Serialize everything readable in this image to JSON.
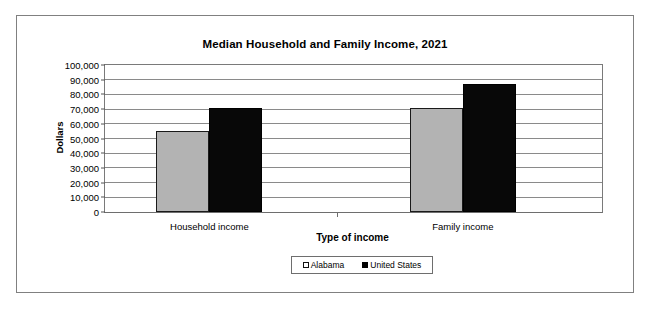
{
  "chart_data": {
    "type": "bar",
    "title": "Median Household and Family Income, 2021",
    "xlabel": "Type of income",
    "ylabel": "Dollars",
    "categories": [
      "Household income",
      "Family income"
    ],
    "series": [
      {
        "name": "Alabama",
        "values": [
          55000,
          71000
        ],
        "color": "#b3b3b3"
      },
      {
        "name": "United States",
        "values": [
          71000,
          87000
        ],
        "color": "#000000"
      }
    ],
    "ylim": [
      0,
      100000
    ],
    "ytick_values": [
      0,
      10000,
      20000,
      30000,
      40000,
      50000,
      60000,
      70000,
      80000,
      90000,
      100000
    ],
    "ytick_labels": [
      "0",
      "10,000",
      "20,000",
      "30,000",
      "40,000",
      "50,000",
      "60,000",
      "70,000",
      "80,000",
      "90,000",
      "100,000"
    ],
    "grid": true,
    "legend_position": "bottom-center",
    "legend": [
      "Alabama",
      "United States"
    ]
  }
}
